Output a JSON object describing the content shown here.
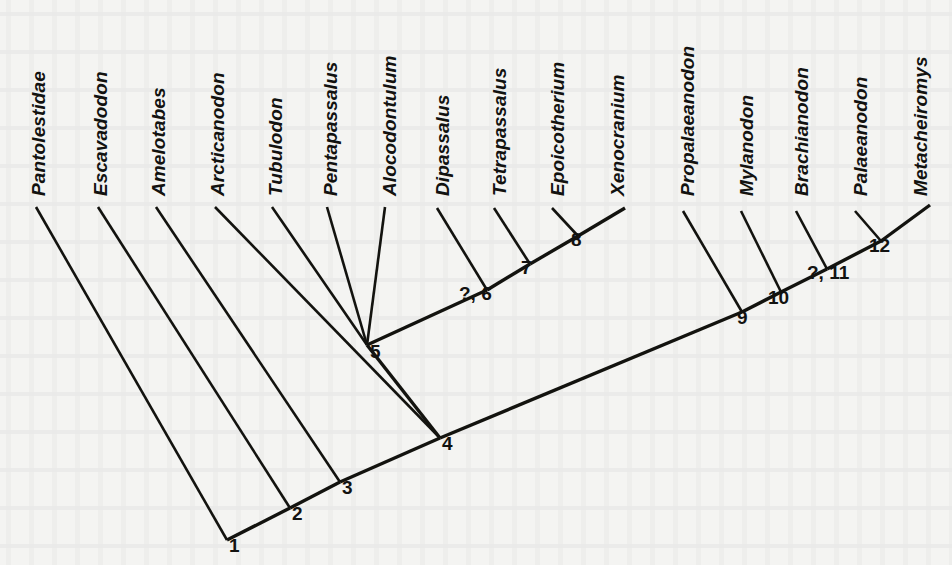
{
  "figure": {
    "type": "cladogram",
    "background_color": "#f4f4f2",
    "line_color": "#13130f"
  },
  "taxa": [
    {
      "id": "pantolestidae",
      "label": "Pantolestidae",
      "label_x": 28,
      "label_y": 196,
      "tip_x": 36,
      "tip_y": 207,
      "attaches_to": "1"
    },
    {
      "id": "escavadodon",
      "label": "Escavadodon",
      "label_x": 90,
      "label_y": 196,
      "tip_x": 98,
      "tip_y": 207,
      "attaches_to": "2"
    },
    {
      "id": "amelotabes",
      "label": "Amelotabes",
      "label_x": 148,
      "label_y": 196,
      "tip_x": 156,
      "tip_y": 207,
      "attaches_to": "3"
    },
    {
      "id": "arcticanodon",
      "label": "Arcticanodon",
      "label_x": 207,
      "label_y": 196,
      "tip_x": 215,
      "tip_y": 207,
      "attaches_to": "4"
    },
    {
      "id": "tubulodon",
      "label": "Tubulodon",
      "label_x": 265,
      "label_y": 196,
      "tip_x": 272,
      "tip_y": 207,
      "attaches_to": "5"
    },
    {
      "id": "pentapassalus",
      "label": "Pentapassalus",
      "label_x": 320,
      "label_y": 196,
      "tip_x": 327,
      "tip_y": 207,
      "attaches_to": "5"
    },
    {
      "id": "alocodontulum",
      "label": "Alocodontulum",
      "label_x": 379,
      "label_y": 196,
      "tip_x": 385,
      "tip_y": 207,
      "attaches_to": "5"
    },
    {
      "id": "dipassalus",
      "label": "Dipassalus",
      "label_x": 432,
      "label_y": 196,
      "tip_x": 437,
      "tip_y": 208,
      "attaches_to": "?, 6"
    },
    {
      "id": "tetrapassalus",
      "label": "Tetrapassalus",
      "label_x": 489,
      "label_y": 196,
      "tip_x": 494,
      "tip_y": 208,
      "attaches_to": "7"
    },
    {
      "id": "epoicotherium",
      "label": "Epoicotherium",
      "label_x": 547,
      "label_y": 196,
      "tip_x": 552,
      "tip_y": 208,
      "attaches_to": "8"
    },
    {
      "id": "xenocranium",
      "label": "Xenocranium",
      "label_x": 607,
      "label_y": 196,
      "tip_x": 625,
      "tip_y": 208,
      "attaches_to": "8"
    },
    {
      "id": "propalaeanodon",
      "label": "Propalaeanodon",
      "label_x": 677,
      "label_y": 196,
      "tip_x": 683,
      "tip_y": 211,
      "attaches_to": "9"
    },
    {
      "id": "mylanodon",
      "label": "Mylanodon",
      "label_x": 736,
      "label_y": 196,
      "tip_x": 741,
      "tip_y": 211,
      "attaches_to": "10"
    },
    {
      "id": "brachianodon",
      "label": "Brachianodon",
      "label_x": 791,
      "label_y": 196,
      "tip_x": 796,
      "tip_y": 211,
      "attaches_to": "?, 11"
    },
    {
      "id": "palaeanodon",
      "label": "Palaeanodon",
      "label_x": 850,
      "label_y": 196,
      "tip_x": 855,
      "tip_y": 211,
      "attaches_to": "12"
    },
    {
      "id": "metacheiromys",
      "label": "Metacheiromys",
      "label_x": 910,
      "label_y": 196,
      "tip_x": 930,
      "tip_y": 205,
      "attaches_to": "12"
    }
  ],
  "nodes": [
    {
      "id": "1",
      "label": "1",
      "x": 227,
      "y": 540,
      "label_x": 229,
      "label_y": 535
    },
    {
      "id": "2",
      "label": "2",
      "x": 290,
      "y": 508,
      "label_x": 292,
      "label_y": 503
    },
    {
      "id": "3",
      "label": "3",
      "x": 340,
      "y": 482,
      "label_x": 342,
      "label_y": 477
    },
    {
      "id": "4",
      "label": "4",
      "x": 440,
      "y": 438,
      "label_x": 442,
      "label_y": 433
    },
    {
      "id": "5",
      "label": "5",
      "x": 367,
      "y": 345,
      "label_x": 370,
      "label_y": 341
    },
    {
      "id": "6",
      "label": "?, 6",
      "x": 487,
      "y": 290,
      "label_x": 459,
      "label_y": 283
    },
    {
      "id": "7",
      "label": "7",
      "x": 530,
      "y": 264,
      "label_x": 521,
      "label_y": 257
    },
    {
      "id": "8",
      "label": "8",
      "x": 578,
      "y": 236,
      "label_x": 571,
      "label_y": 229
    },
    {
      "id": "9",
      "label": "9",
      "x": 742,
      "y": 312,
      "label_x": 737,
      "label_y": 307
    },
    {
      "id": "10",
      "label": "10",
      "x": 781,
      "y": 292,
      "label_x": 768,
      "label_y": 287
    },
    {
      "id": "11",
      "label": "?, 11",
      "x": 827,
      "y": 269,
      "label_x": 807,
      "label_y": 262
    },
    {
      "id": "12",
      "label": "12",
      "x": 881,
      "y": 241,
      "label_x": 869,
      "label_y": 235
    }
  ],
  "branches": {
    "note": "Main backbone runs from root node 1 up to the right; a secondary backbone branches at node 4 up to node 5 and on to Xenocranium."
  }
}
